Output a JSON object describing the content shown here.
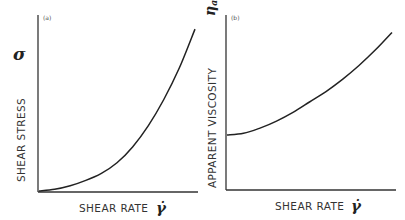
{
  "chart_data": [
    {
      "type": "line",
      "panel_label": "(a)",
      "title": "",
      "xlabel": "SHEAR RATE",
      "xlabel_symbol": "γ̇",
      "ylabel": "SHEAR STRESS",
      "ylabel_symbol": "σ",
      "xlim": [
        0,
        1
      ],
      "ylim": [
        0,
        1
      ],
      "grid": false,
      "ticks": false,
      "series": [
        {
          "name": "shear stress vs shear rate",
          "x": [
            0.0,
            0.1,
            0.2,
            0.3,
            0.4,
            0.5,
            0.6,
            0.7,
            0.8,
            0.9,
            1.0
          ],
          "y": [
            0.0,
            0.01,
            0.03,
            0.06,
            0.1,
            0.16,
            0.25,
            0.37,
            0.52,
            0.7,
            0.92
          ]
        }
      ]
    },
    {
      "type": "line",
      "panel_label": "(b)",
      "title": "",
      "xlabel": "SHEAR RATE",
      "xlabel_symbol": "γ̇",
      "ylabel": "APPARENT VISCOSITY",
      "ylabel_symbol": "ηa",
      "xlim": [
        0,
        1
      ],
      "ylim": [
        0,
        1
      ],
      "grid": false,
      "ticks": false,
      "series": [
        {
          "name": "apparent viscosity vs shear rate",
          "x": [
            0.0,
            0.1,
            0.2,
            0.3,
            0.4,
            0.5,
            0.6,
            0.7,
            0.8,
            0.9,
            1.0
          ],
          "y": [
            0.31,
            0.32,
            0.35,
            0.39,
            0.44,
            0.5,
            0.56,
            0.63,
            0.71,
            0.8,
            0.9
          ]
        }
      ]
    }
  ]
}
